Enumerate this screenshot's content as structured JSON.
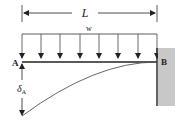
{
  "diagram": {
    "labels": {
      "length": "L",
      "load": "w",
      "free_end": "A",
      "fixed_end": "B",
      "deflection": "δ",
      "deflection_sub": "A"
    },
    "colors": {
      "line": "#222222",
      "wall": "#c8c8c8",
      "curve": "#555555"
    },
    "load_arrows_count": 8
  }
}
